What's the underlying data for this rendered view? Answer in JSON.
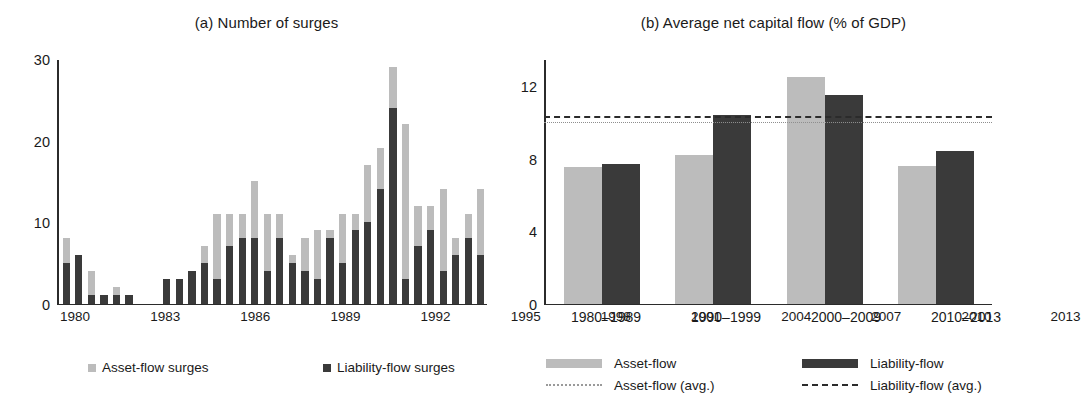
{
  "figure": {
    "panels": [
      {
        "key": "a",
        "title": "(a) Number of surges"
      },
      {
        "key": "b",
        "title": "(b) Average net capital flow (% of GDP)"
      }
    ]
  },
  "panel_a": {
    "title": "(a) Number of surges",
    "y_ticks": [
      "0",
      "10",
      "20",
      "30"
    ],
    "x_tick_labels": [
      "1980",
      "1983",
      "1986",
      "1989",
      "1992",
      "1995",
      "1998",
      "2001",
      "2004",
      "2007",
      "2010",
      "2013"
    ],
    "legend": [
      {
        "label": "Asset-flow surges",
        "color": "#bcbcbc",
        "marker": "square"
      },
      {
        "label": "Liability-flow surges",
        "color": "#3a3a3a",
        "marker": "square"
      }
    ]
  },
  "panel_b": {
    "title": "(b) Average net capital flow (% of GDP)",
    "y_ticks": [
      "0",
      "4",
      "8",
      "12"
    ],
    "x_tick_labels": [
      "1980–1989",
      "1990–1999",
      "2000–2009",
      "2010–2013"
    ],
    "legend": [
      {
        "label": "Asset-flow",
        "color": "#bcbcbc",
        "marker": "bar"
      },
      {
        "label": "Liability-flow",
        "color": "#3a3a3a",
        "marker": "bar"
      },
      {
        "label": "Asset-flow (avg.)",
        "color": "#9a9a9a",
        "marker": "dotted-line"
      },
      {
        "label": "Liability-flow (avg.)",
        "color": "#2b2b2b",
        "marker": "dashed-line"
      }
    ]
  },
  "chart_data": [
    {
      "type": "bar",
      "panel": "a",
      "stacked": true,
      "title": "(a) Number of surges",
      "xlabel": "",
      "ylabel": "",
      "ylim": [
        0,
        30
      ],
      "yticks": [
        0,
        10,
        20,
        30
      ],
      "grid": false,
      "legend_position": "bottom",
      "categories": [
        1980,
        1981,
        1982,
        1983,
        1984,
        1985,
        1986,
        1987,
        1988,
        1989,
        1990,
        1991,
        1992,
        1993,
        1994,
        1995,
        1996,
        1997,
        1998,
        1999,
        2000,
        2001,
        2002,
        2003,
        2004,
        2005,
        2006,
        2007,
        2008,
        2009,
        2010,
        2011,
        2012,
        2013
      ],
      "series": [
        {
          "name": "Liability-flow surges",
          "color": "#3a3a3a",
          "values": [
            5,
            6,
            1,
            1,
            1,
            1,
            0,
            0,
            3,
            3,
            4,
            5,
            3,
            7,
            8,
            8,
            4,
            8,
            5,
            4,
            3,
            8,
            5,
            9,
            10,
            14,
            24,
            3,
            7,
            9,
            4,
            6,
            8,
            6
          ]
        },
        {
          "name": "Asset-flow surges",
          "color": "#bcbcbc",
          "values": [
            3,
            0,
            3,
            0,
            1,
            0,
            0,
            0,
            0,
            0,
            0,
            2,
            8,
            4,
            3,
            7,
            7,
            3,
            1,
            4,
            6,
            1,
            6,
            2,
            7,
            5,
            5,
            19,
            5,
            3,
            10,
            2,
            3,
            8
          ]
        }
      ],
      "totals": [
        8,
        6,
        4,
        1,
        2,
        1,
        0,
        0,
        3,
        3,
        4,
        7,
        11,
        11,
        11,
        15,
        11,
        11,
        6,
        8,
        9,
        9,
        11,
        11,
        17,
        19,
        29,
        22,
        12,
        12,
        14,
        8,
        11,
        14
      ]
    },
    {
      "type": "bar",
      "panel": "b",
      "stacked": false,
      "title": "(b) Average net capital flow (% of GDP)",
      "xlabel": "",
      "ylabel": "",
      "ylim": [
        0,
        13.5
      ],
      "yticks": [
        0,
        4,
        8,
        12
      ],
      "grid": false,
      "legend_position": "bottom",
      "categories": [
        "1980–1989",
        "1990–1999",
        "2000–2009",
        "2010–2013"
      ],
      "series": [
        {
          "name": "Asset-flow",
          "color": "#bcbcbc",
          "values": [
            7.5,
            8.2,
            12.5,
            7.6
          ]
        },
        {
          "name": "Liability-flow",
          "color": "#3a3a3a",
          "values": [
            7.7,
            10.4,
            11.5,
            8.4
          ]
        }
      ],
      "reference_lines": [
        {
          "name": "Asset-flow (avg.)",
          "value": 10.1,
          "style": "dotted",
          "color": "#9a9a9a"
        },
        {
          "name": "Liability-flow (avg.)",
          "value": 10.4,
          "style": "dashed",
          "color": "#2b2b2b"
        }
      ]
    }
  ]
}
